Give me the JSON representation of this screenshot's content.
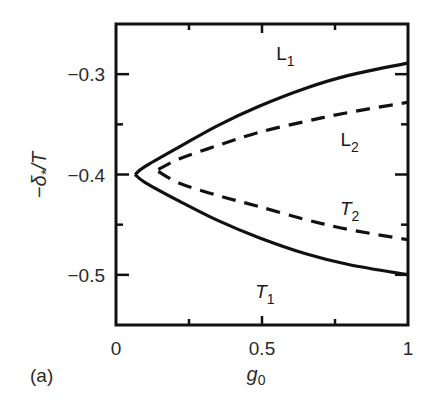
{
  "chart_data": {
    "type": "line",
    "title": "",
    "panel_label": "(a)",
    "xlabel": "g0",
    "ylabel": "−δ*/T",
    "xlim": [
      0,
      1
    ],
    "ylim": [
      -0.55,
      -0.25
    ],
    "xticks": [
      0,
      0.5,
      1
    ],
    "xtick_labels": [
      "0",
      "0.5",
      "1"
    ],
    "xminor_ticks": [
      0.25,
      0.75
    ],
    "yticks": [
      -0.3,
      -0.4,
      -0.5
    ],
    "ytick_labels": [
      "−0.3",
      "−0.4",
      "−0.5"
    ],
    "yminor_ticks": [
      -0.35,
      -0.45
    ],
    "grid": false,
    "legend": "none (inline curve labels)",
    "series": [
      {
        "name": "L1",
        "style": "solid",
        "x": [
          0.065,
          0.1,
          0.22,
          0.35,
          0.49,
          0.65,
          0.8,
          1.0
        ],
        "y": [
          -0.4,
          -0.392,
          -0.372,
          -0.351,
          -0.332,
          -0.314,
          -0.301,
          -0.289
        ]
      },
      {
        "name": "L2",
        "style": "dashed",
        "x": [
          0.145,
          0.22,
          0.35,
          0.49,
          0.65,
          0.8,
          1.0
        ],
        "y": [
          -0.395,
          -0.384,
          -0.371,
          -0.358,
          -0.347,
          -0.338,
          -0.328
        ]
      },
      {
        "name": "T2",
        "style": "dashed",
        "x": [
          0.145,
          0.22,
          0.35,
          0.49,
          0.65,
          0.8,
          1.0
        ],
        "y": [
          -0.397,
          -0.409,
          -0.421,
          -0.432,
          -0.445,
          -0.455,
          -0.465
        ]
      },
      {
        "name": "T1",
        "style": "solid",
        "x": [
          0.065,
          0.1,
          0.22,
          0.35,
          0.49,
          0.65,
          0.8,
          1.0
        ],
        "y": [
          -0.4,
          -0.408,
          -0.427,
          -0.446,
          -0.463,
          -0.479,
          -0.49,
          -0.5
        ]
      }
    ],
    "annotations": [
      {
        "text": "L",
        "sub": "1",
        "italic": false,
        "x": 0.58,
        "y": -0.286
      },
      {
        "text": "L",
        "sub": "2",
        "italic": false,
        "x": 0.8,
        "y": -0.372
      },
      {
        "text": "T",
        "sub": "2",
        "italic": true,
        "x": 0.8,
        "y": -0.44
      },
      {
        "text": "T",
        "sub": "1",
        "italic": true,
        "x": 0.51,
        "y": -0.523
      }
    ]
  }
}
